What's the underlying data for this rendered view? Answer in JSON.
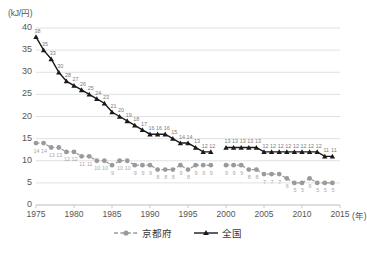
{
  "axes": {
    "y_unit": "(kJ/円)",
    "x_unit": "(年)",
    "y_ticks": [
      "0",
      "5",
      "10",
      "15",
      "20",
      "25",
      "30",
      "35",
      "40"
    ],
    "x_ticks": [
      "1975",
      "1980",
      "1985",
      "1990",
      "1995",
      "2000",
      "2005",
      "2010",
      "2015"
    ]
  },
  "legend": {
    "items": [
      {
        "label": "京都府",
        "color": "#9a9a9a",
        "marker": "circle",
        "dash": true
      },
      {
        "label": "全国",
        "color": "#1a1a1a",
        "marker": "triangle",
        "dash": false
      }
    ]
  },
  "chart_data": {
    "type": "line",
    "title": "",
    "xlabel": "(年)",
    "ylabel": "(kJ/円)",
    "xlim": [
      1975,
      2015
    ],
    "ylim": [
      0,
      40
    ],
    "ytick_step": 5,
    "grid": "horizontal",
    "legend_position": "bottom-center",
    "note": "Series break between 1998 and 2000 (both series discontinuous).",
    "x": [
      1975,
      1976,
      1977,
      1978,
      1979,
      1980,
      1981,
      1982,
      1983,
      1984,
      1985,
      1986,
      1987,
      1988,
      1989,
      1990,
      1991,
      1992,
      1993,
      1994,
      1995,
      1996,
      1997,
      1998,
      2000,
      2001,
      2002,
      2003,
      2004,
      2005,
      2006,
      2007,
      2008,
      2009,
      2010,
      2011,
      2012,
      2013,
      2014
    ],
    "series": [
      {
        "name": "全国",
        "color": "#1a1a1a",
        "marker": "triangle",
        "values": [
          38,
          35,
          33,
          30,
          28,
          27,
          26,
          25,
          24,
          23,
          21,
          20,
          19,
          18,
          17,
          16,
          16,
          16,
          15,
          14,
          14,
          13,
          12,
          12,
          13,
          13,
          13,
          13,
          13,
          12,
          12,
          12,
          12,
          12,
          12,
          12,
          12,
          11,
          11
        ]
      },
      {
        "name": "京都府",
        "color": "#9a9a9a",
        "marker": "circle",
        "values": [
          14,
          14,
          13,
          13,
          12,
          12,
          11,
          11,
          10,
          10,
          9,
          10,
          10,
          9,
          9,
          9,
          8,
          8,
          8,
          9,
          8,
          9,
          9,
          9,
          9,
          9,
          9,
          8,
          8,
          7,
          7,
          7,
          6,
          5,
          5,
          6,
          5,
          5,
          5
        ]
      }
    ],
    "point_labels": {
      "全国": [
        "38",
        "35",
        "33",
        "30",
        "28",
        "27",
        "26",
        "25",
        "24",
        "23",
        "21",
        "20",
        "19",
        "18",
        "17",
        "16",
        "16",
        "16",
        "15",
        "14",
        "14",
        "13",
        "12",
        "12",
        "13",
        "13",
        "13",
        "13",
        "13",
        "12",
        "12",
        "12",
        "12",
        "12",
        "12",
        "12",
        "12",
        "11",
        "11"
      ],
      "京都府": [
        "14",
        "14",
        "13",
        "13",
        "12",
        "12",
        "11",
        "11",
        "10",
        "10",
        "9",
        "10",
        "10",
        "9",
        "9",
        "9",
        "8",
        "8",
        "8",
        "9",
        "8",
        "9",
        "9",
        "9",
        "9",
        "9",
        "9",
        "8",
        "8",
        "7",
        "7",
        "7",
        "6",
        "5",
        "5",
        "6",
        "5",
        "5",
        "5"
      ]
    }
  }
}
